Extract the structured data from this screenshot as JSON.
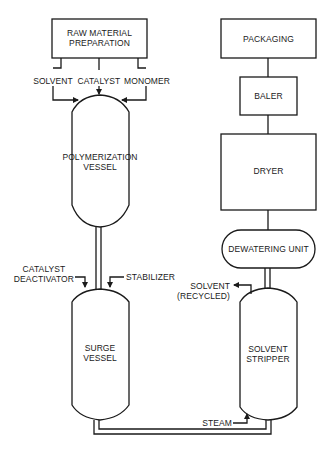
{
  "diagram": {
    "type": "process-flow",
    "stroke_color": "#1a1a1a",
    "background": "#ffffff",
    "nodes": {
      "raw_material": {
        "line1": "RAW MATERIAL",
        "line2": "PREPARATION",
        "shape": "rectangle"
      },
      "polymerization": {
        "line1": "POLYMERIZATION",
        "line2": "VESSEL",
        "shape": "vessel"
      },
      "surge": {
        "line1": "SURGE",
        "line2": "VESSEL",
        "shape": "vessel"
      },
      "stripper": {
        "line1": "SOLVENT",
        "line2": "STRIPPER",
        "shape": "vessel"
      },
      "dewatering": {
        "label": "DEWATERING UNIT",
        "shape": "rounded-rectangle"
      },
      "dryer": {
        "label": "DRYER",
        "shape": "rectangle"
      },
      "baler": {
        "label": "BALER",
        "shape": "rectangle"
      },
      "packaging": {
        "label": "PACKAGING",
        "shape": "rectangle"
      }
    },
    "streams": {
      "solvent": "SOLVENT",
      "catalyst": "CATALYST",
      "monomer": "MONOMER",
      "catalyst_deactivator_1": "CATALYST",
      "catalyst_deactivator_2": "DEACTIVATOR",
      "stabilizer": "STABILIZER",
      "solvent_recycled_1": "SOLVENT",
      "solvent_recycled_2": "(RECYCLED)",
      "steam": "STEAM"
    },
    "edges": [
      {
        "from": "raw_material",
        "to": "polymerization",
        "label": "SOLVENT"
      },
      {
        "from": "raw_material",
        "to": "polymerization",
        "label": "CATALYST"
      },
      {
        "from": "raw_material",
        "to": "polymerization",
        "label": "MONOMER"
      },
      {
        "from": "polymerization",
        "to": "surge"
      },
      {
        "from": "CATALYST DEACTIVATOR",
        "to": "surge"
      },
      {
        "from": "STABILIZER",
        "to": "surge"
      },
      {
        "from": "surge",
        "to": "stripper"
      },
      {
        "from": "STEAM",
        "to": "stripper"
      },
      {
        "from": "stripper",
        "to": "SOLVENT (RECYCLED)"
      },
      {
        "from": "stripper",
        "to": "dewatering"
      },
      {
        "from": "dewatering",
        "to": "dryer"
      },
      {
        "from": "dryer",
        "to": "baler"
      },
      {
        "from": "baler",
        "to": "packaging"
      }
    ]
  }
}
